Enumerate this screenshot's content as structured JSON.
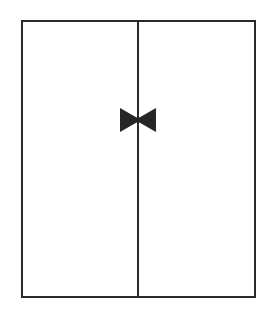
{
  "canvas": {
    "width": 270,
    "height": 317,
    "background_color": "#ffffff"
  },
  "drawing": {
    "title": "Double-leaf panel with center butterfly valve symbol",
    "stroke_color": "#2b2b2b",
    "fill_color": "#ffffff",
    "symbol_color": "#262626",
    "outer_frame": {
      "label": "outer-rectangle",
      "x": 21,
      "y": 20,
      "width": 235,
      "height": 278,
      "stroke_width": 2
    },
    "center_divider": {
      "label": "vertical-center-line",
      "x": 138,
      "y_start": 20,
      "y_end": 298,
      "stroke_width": 2
    },
    "bowtie_symbol": {
      "label": "bowtie-butterfly-valve",
      "center_x": 138,
      "center_y": 120,
      "half_width": 18,
      "half_height": 12,
      "waist_half_height": 2.2
    }
  }
}
